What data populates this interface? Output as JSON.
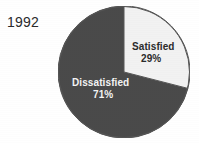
{
  "chart_data": {
    "type": "pie",
    "title": "1992",
    "xlabel": "",
    "ylabel": "",
    "legend_position": "none",
    "grid": false,
    "categories": [
      "Satisfied",
      "Dissatisfied"
    ],
    "values": [
      29,
      71
    ],
    "unit": "%",
    "slices": [
      {
        "label": "Satisfied",
        "value": 29,
        "value_label": "29%",
        "color": "#f2f2f2",
        "text_color": "#2b2b2b",
        "start_angle_deg": 0,
        "end_angle_deg": 104.4
      },
      {
        "label": "Dissatisfied",
        "value": 71,
        "value_label": "71%",
        "color": "#4a4a4a",
        "text_color": "#f4f4f4",
        "start_angle_deg": 104.4,
        "end_angle_deg": 360
      }
    ]
  },
  "figure": {
    "year_label": "1992",
    "background_color": "#ffffff",
    "outline_color": "#555555"
  },
  "labels": {
    "satisfied_name": "Satisfied",
    "satisfied_value": "29%",
    "dissatisfied_name": "Dissatisfied",
    "dissatisfied_value": "71%"
  }
}
